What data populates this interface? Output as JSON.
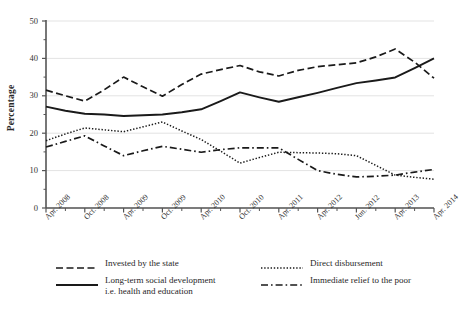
{
  "chart_data": {
    "type": "line",
    "title": "",
    "xlabel": "",
    "ylabel": "Percentage",
    "ylim": [
      0,
      50
    ],
    "yticks": [
      0,
      10,
      20,
      30,
      40,
      50
    ],
    "yticks_minor": [
      5,
      15,
      25,
      35,
      45
    ],
    "grid": "horizontal-major",
    "legend_position": "bottom",
    "x": [
      "Apr. 2008",
      "",
      "Oct. 2008",
      "",
      "Apr. 2009",
      "",
      "Oct. 2009",
      "",
      "Apr. 2010",
      "",
      "Oct. 2010",
      "",
      "Apr. 2011",
      "",
      "Apr. 2012",
      "",
      "Jun. 2012",
      "",
      "Apr. 2013",
      "",
      "Apr. 2014"
    ],
    "xtick_labels": [
      "Apr. 2008",
      "Oct. 2008",
      "Apr. 2009",
      "Oct. 2009",
      "Apr. 2010",
      "Oct. 2010",
      "Apr. 2011",
      "Apr. 2012",
      "Jun. 2012",
      "Apr. 2013",
      "Apr. 2014"
    ],
    "series": [
      {
        "name": "Invested by the state",
        "style": "dashed",
        "color": "#1a1a1a",
        "values": [
          31.5,
          30.0,
          28.6,
          31.6,
          35.0,
          32.4,
          29.9,
          33.0,
          35.8,
          37.0,
          38.1,
          36.4,
          35.3,
          36.8,
          37.8,
          38.3,
          38.8,
          40.4,
          42.5,
          39.0,
          34.7
        ]
      },
      {
        "name": "Long-term social development\ni.e. health and education",
        "style": "solid",
        "color": "#1a1a1a",
        "values": [
          27.1,
          26.0,
          25.2,
          25.0,
          24.6,
          24.8,
          25.0,
          25.6,
          26.4,
          28.6,
          30.9,
          29.6,
          28.4,
          29.6,
          30.8,
          32.1,
          33.4,
          34.1,
          34.9,
          37.4,
          40.0
        ]
      },
      {
        "name": "Direct disbursement",
        "style": "dotted",
        "color": "#1a1a1a",
        "values": [
          18.0,
          19.8,
          21.4,
          20.9,
          20.4,
          21.7,
          23.0,
          20.6,
          18.3,
          15.2,
          12.0,
          13.5,
          14.9,
          14.8,
          14.7,
          14.5,
          14.0,
          11.4,
          8.8,
          8.2,
          7.7
        ]
      },
      {
        "name": "Immediate relief to the poor",
        "style": "dashdot",
        "color": "#1a1a1a",
        "values": [
          16.3,
          17.8,
          19.3,
          16.6,
          14.0,
          15.3,
          16.5,
          15.7,
          14.9,
          15.6,
          16.1,
          16.1,
          16.1,
          13.0,
          10.0,
          9.0,
          8.3,
          8.5,
          8.8,
          9.6,
          10.3
        ]
      }
    ]
  },
  "axes": {
    "ylabel": "Percentage",
    "ytick_labels": [
      "0",
      "10",
      "20",
      "30",
      "40",
      "50"
    ]
  },
  "legend": {
    "items": [
      {
        "label": "Invested by the state",
        "style": "dashed"
      },
      {
        "label": "Long-term social development\ni.e. health and education",
        "style": "solid"
      },
      {
        "label": "Direct disbursement",
        "style": "dotted"
      },
      {
        "label": "Immediate relief to the poor",
        "style": "dashdot"
      }
    ]
  }
}
